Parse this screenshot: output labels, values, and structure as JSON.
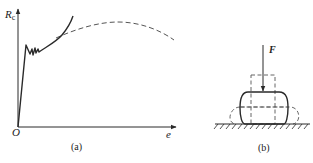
{
  "panel_a": {
    "caption": "(a)",
    "y_axis_label_main": "R",
    "y_axis_label_sub": "c",
    "x_axis_label": "e",
    "origin_label": "O",
    "curves": [
      {
        "name": "compression-curve-ductile",
        "style": "solid",
        "description": "elastic rise, yield wiggle, then rising hardening curve"
      },
      {
        "name": "compression-curve-brittle-reference",
        "style": "dashed",
        "description": "arc rising to a maximum then falling"
      }
    ]
  },
  "panel_b": {
    "caption": "(b)",
    "force_label": "F",
    "shapes": [
      {
        "name": "original-specimen",
        "style": "dashed"
      },
      {
        "name": "barrel-deformed-specimen",
        "style": "solid"
      },
      {
        "name": "further-flattened-specimen",
        "style": "dashed"
      },
      {
        "name": "ground-support",
        "style": "hatched"
      }
    ]
  },
  "colors": {
    "line": "#2a2a2a",
    "dashed": "#555555",
    "background": "#ffffff"
  }
}
